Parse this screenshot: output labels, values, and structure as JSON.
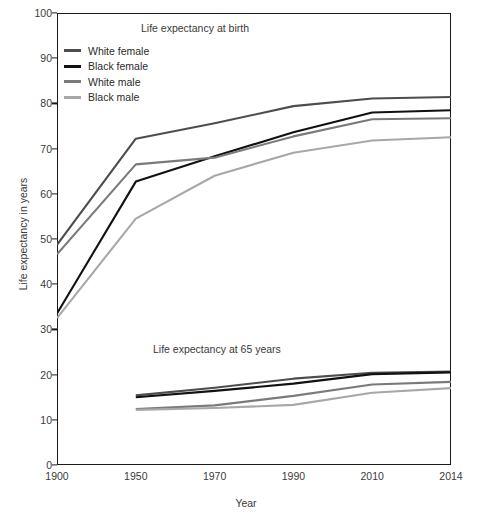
{
  "chart_data": {
    "type": "line",
    "title": "",
    "xlabel": "Year",
    "ylabel": "Life expectancy in years",
    "categories": [
      "1900",
      "1950",
      "1970",
      "1990",
      "2010",
      "2014"
    ],
    "ylim": [
      0,
      100
    ],
    "y_ticks": [
      0,
      10,
      20,
      30,
      40,
      50,
      60,
      70,
      80,
      90,
      100
    ],
    "grid": false,
    "legend_position": "top-left inside plot",
    "annotations": [
      {
        "text": "Life expectancy at birth",
        "panel": "upper"
      },
      {
        "text": "Life expectancy at 65 years",
        "panel": "lower"
      }
    ],
    "panels": [
      {
        "name": "Life expectancy at birth",
        "series": [
          {
            "name": "White female",
            "color": "#4d4d4d",
            "values": [
              48.7,
              72.2,
              75.6,
              79.4,
              81.1,
              81.4
            ]
          },
          {
            "name": "Black female",
            "color": "#111111",
            "values": [
              33.5,
              62.7,
              68.3,
              73.6,
              78.0,
              78.5
            ]
          },
          {
            "name": "White male",
            "color": "#7a7a7a",
            "values": [
              46.6,
              66.5,
              68.0,
              72.7,
              76.5,
              76.7
            ]
          },
          {
            "name": "Black male",
            "color": "#a8a8a8",
            "values": [
              32.5,
              54.5,
              64.0,
              69.1,
              71.8,
              72.5
            ]
          }
        ]
      },
      {
        "name": "Life expectancy at 65 years",
        "x_start_index": 1,
        "series": [
          {
            "name": "White female",
            "color": "#4d4d4d",
            "values": [
              15.4,
              17.1,
              19.1,
              20.4,
              20.7
            ]
          },
          {
            "name": "Black female",
            "color": "#111111",
            "values": [
              15.0,
              16.4,
              18.0,
              20.1,
              20.5
            ]
          },
          {
            "name": "White male",
            "color": "#7a7a7a",
            "values": [
              12.4,
              13.2,
              15.3,
              17.8,
              18.4
            ]
          },
          {
            "name": "Black male",
            "color": "#a8a8a8",
            "values": [
              12.2,
              12.6,
              13.3,
              16.0,
              17.0
            ]
          }
        ]
      }
    ]
  },
  "legend": {
    "items": [
      {
        "label": "White female",
        "color": "#4d4d4d"
      },
      {
        "label": "Black female",
        "color": "#111111"
      },
      {
        "label": "White male",
        "color": "#7a7a7a"
      },
      {
        "label": "Black male",
        "color": "#a8a8a8"
      }
    ]
  },
  "axes": {
    "y_title": "Life expectancy in years",
    "x_title": "Year",
    "y_tick_labels": [
      "100",
      "90",
      "80",
      "70",
      "60",
      "50",
      "40",
      "30",
      "20",
      "10",
      "0"
    ],
    "x_tick_labels": [
      "1900",
      "1950",
      "1970",
      "1990",
      "2010",
      "2014"
    ]
  },
  "notes": {
    "birth": "Life expectancy at birth",
    "at65": "Life expectancy at 65 years"
  }
}
